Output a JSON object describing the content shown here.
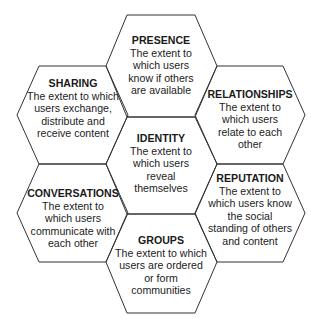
{
  "diagram": {
    "type": "honeycomb",
    "stroke_color": "#333333",
    "hexagons": [
      {
        "id": "presence",
        "title": "PRESENCE",
        "description": "The extent to which users know if others are available"
      },
      {
        "id": "sharing",
        "title": "SHARING",
        "description": "The extent to which users exchange, distribute and receive content"
      },
      {
        "id": "relationships",
        "title": "RELATIONSHIPS",
        "description": "The extent to which users relate to each other"
      },
      {
        "id": "identity",
        "title": "IDENTITY",
        "description": "The extent to which users reveal themselves"
      },
      {
        "id": "conversations",
        "title": "CONVERSATIONS",
        "description": "The extent to which users communicate with each other"
      },
      {
        "id": "reputation",
        "title": "REPUTATION",
        "description": "The extent to which users know the social standing of others and content"
      },
      {
        "id": "groups",
        "title": "GROUPS",
        "description": "The extent to which users are ordered or form communities"
      }
    ]
  }
}
